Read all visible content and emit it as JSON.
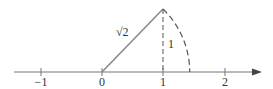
{
  "diagram": {
    "number_line": {
      "tick_labels": [
        "−1",
        "0",
        "1",
        "2"
      ],
      "tick_values": [
        -1,
        0,
        1,
        2
      ],
      "x_min": -1.4,
      "x_max": 2.5
    },
    "triangle": {
      "hypotenuse_label": "√2",
      "vertical_leg_label": "1",
      "vertices": [
        [
          0,
          0
        ],
        [
          1,
          0
        ],
        [
          1,
          1
        ]
      ]
    },
    "arc": {
      "center": 0,
      "radius_label": "√2",
      "ends_at": 1.414
    },
    "colors": {
      "axis": "#666666",
      "hypotenuse": "#888888",
      "dashed": "#555555",
      "text": "#333333"
    }
  }
}
